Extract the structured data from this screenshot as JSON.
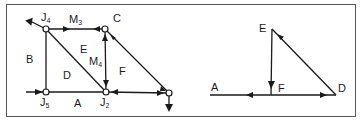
{
  "figure": {
    "type": "truss-diagram-with-force-polygon",
    "colors": {
      "line": "#1a1a1a",
      "frame": "#555555",
      "background": "#ffffff"
    }
  },
  "space_diagram": {
    "joints": [
      {
        "id": "J4",
        "label": "J",
        "sub": "4",
        "x": 46,
        "y": 29
      },
      {
        "id": "C",
        "label": "C",
        "sub": "",
        "x": 105,
        "y": 29
      },
      {
        "id": "J5",
        "label": "J",
        "sub": "5",
        "x": 46,
        "y": 92
      },
      {
        "id": "J2",
        "label": "J",
        "sub": "2",
        "x": 106,
        "y": 92
      },
      {
        "id": "R",
        "label": "",
        "sub": "",
        "x": 169,
        "y": 93
      }
    ],
    "member_labels": [
      {
        "text": "M",
        "sub": "3",
        "x": 70,
        "y": 16
      },
      {
        "text": "M",
        "sub": "4",
        "x": 91,
        "y": 56
      }
    ],
    "region_labels": [
      {
        "text": "B",
        "x": 26,
        "y": 55
      },
      {
        "text": "E",
        "x": 80,
        "y": 45
      },
      {
        "text": "D",
        "x": 63,
        "y": 71
      },
      {
        "text": "F",
        "x": 119,
        "y": 67
      },
      {
        "text": "A",
        "x": 74,
        "y": 98
      }
    ]
  },
  "force_polygon": {
    "points": [
      {
        "label": "E",
        "x": 272,
        "y": 29
      },
      {
        "label": "F",
        "x": 271,
        "y": 95
      },
      {
        "label": "A",
        "x": 210,
        "y": 95
      },
      {
        "label": "D",
        "x": 336,
        "y": 95
      }
    ],
    "labels": [
      {
        "text": "E",
        "x": 259,
        "y": 23
      },
      {
        "text": "F",
        "x": 277,
        "y": 83
      },
      {
        "text": "A",
        "x": 211,
        "y": 82
      },
      {
        "text": "D",
        "x": 337,
        "y": 83
      }
    ]
  }
}
